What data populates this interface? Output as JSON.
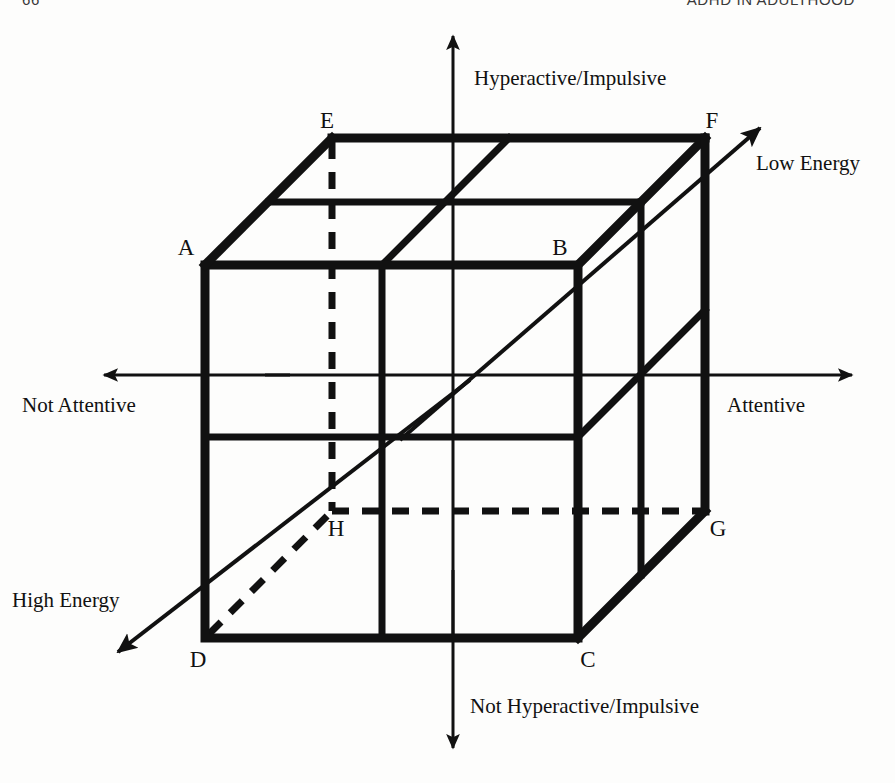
{
  "page": {
    "folio": "66",
    "running_title": "ADHD IN ADULTHOOD",
    "background_color": "#fdfdfc",
    "ink_color": "#111111"
  },
  "figure": {
    "type": "three-dimensional-axis-cube-diagram",
    "axes": [
      {
        "id": "vertical",
        "name": "hyperactivity-axis",
        "positive_label": "Hyperactive/Impulsive",
        "negative_label": "Not Hyperactive/Impulsive",
        "orientation": "vertical",
        "positive_direction": "up",
        "negative_direction": "down"
      },
      {
        "id": "horizontal",
        "name": "attention-axis",
        "positive_label": "Attentive",
        "negative_label": "Not Attentive",
        "orientation": "horizontal",
        "positive_direction": "right",
        "negative_direction": "left"
      },
      {
        "id": "depth",
        "name": "energy-axis",
        "positive_label": "Low Energy",
        "negative_label": "High Energy",
        "orientation": "diagonal",
        "positive_direction": "up-right",
        "negative_direction": "down-left"
      }
    ],
    "axis_labels": {
      "top": "Hyperactive/Impulsive",
      "bottom": "Not Hyperactive/Impulsive",
      "left": "Not Attentive",
      "right": "Attentive",
      "depth_far": "Low Energy",
      "depth_near": "High Energy"
    },
    "vertices": [
      {
        "id": "A",
        "label": "A",
        "role": "front-top-left",
        "hidden": false,
        "x": 205,
        "y": 265,
        "label_x": 186,
        "label_y": 255
      },
      {
        "id": "B",
        "label": "B",
        "role": "front-top-right",
        "hidden": false,
        "x": 578,
        "y": 265,
        "label_x": 560,
        "label_y": 255
      },
      {
        "id": "C",
        "label": "C",
        "role": "front-bottom-right",
        "hidden": false,
        "x": 578,
        "y": 638,
        "label_x": 585,
        "label_y": 665
      },
      {
        "id": "D",
        "label": "D",
        "role": "front-bottom-left",
        "hidden": false,
        "x": 205,
        "y": 638,
        "label_x": 196,
        "label_y": 665
      },
      {
        "id": "E",
        "label": "E",
        "role": "back-top-left",
        "hidden": false,
        "x": 332,
        "y": 138,
        "label_x": 322,
        "label_y": 127
      },
      {
        "id": "F",
        "label": "F",
        "role": "back-top-right",
        "hidden": false,
        "x": 705,
        "y": 138,
        "label_x": 704,
        "label_y": 127
      },
      {
        "id": "G",
        "label": "G",
        "role": "back-bottom-right",
        "hidden": true,
        "x": 705,
        "y": 511,
        "label_x": 714,
        "label_y": 534
      },
      {
        "id": "H",
        "label": "H",
        "role": "back-bottom-left",
        "hidden": true,
        "x": 332,
        "y": 511,
        "label_x": 328,
        "label_y": 534
      }
    ],
    "octant_count": 8,
    "line_styles": {
      "cube_edge": "solid-heavy",
      "hidden_edge": "dashed-heavy",
      "axis": "solid-thin",
      "depth_axis": "solid-medium"
    }
  }
}
